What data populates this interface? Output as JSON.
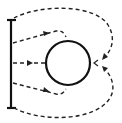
{
  "diagram": {
    "colors": {
      "stroke": "#111111",
      "dashed": "#222222",
      "background": "#ffffff"
    },
    "elements": {
      "source_bar": {
        "x": 11,
        "y_top": 20,
        "y_bottom": 108
      },
      "circle": {
        "cx": 68,
        "cy": 63,
        "r": 22
      },
      "paths": [
        {
          "id": "outer-top",
          "style": "dashed",
          "arrow": "at rear, pointing to circle back"
        },
        {
          "id": "upper",
          "style": "dashed",
          "arrow": "pointing right"
        },
        {
          "id": "middle",
          "style": "dashed",
          "arrow": "pointing right"
        },
        {
          "id": "lower",
          "style": "dashed",
          "arrow": "pointing right"
        },
        {
          "id": "outer-bottom",
          "style": "dashed",
          "arrow": "at rear, pointing to circle back"
        }
      ],
      "rear_mark": "<"
    }
  }
}
